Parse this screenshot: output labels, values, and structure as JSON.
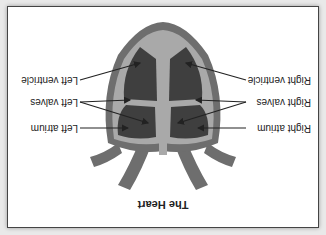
{
  "diagram": {
    "title": "The Heart",
    "orientation": "rotated 180 degrees",
    "labels": {
      "right_ventricle": "Right ventricle",
      "left_ventricle": "Left ventricle",
      "right_valves": "Right valves",
      "left_valves": "Left valves",
      "right_atrium": "Right atrium",
      "left_atrium": "Left atrium"
    },
    "colors": {
      "wall": "#6e6e6e",
      "chamber": "#3f3f3f",
      "septum": "#a9a9a9",
      "background": "#ffffff",
      "arrow": "#222222"
    }
  }
}
